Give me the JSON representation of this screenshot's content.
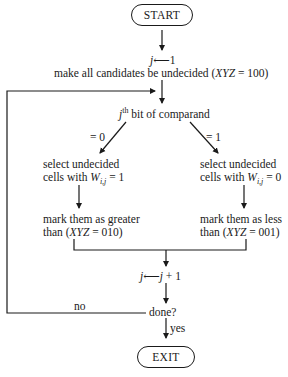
{
  "flowchart": {
    "start": "START",
    "init_assign": {
      "var": "j",
      "arrow": "⟵",
      "value": "1"
    },
    "init_text": "make all candidates be undecided (",
    "init_code": "XYZ",
    "init_eq": " = 100)",
    "decision": {
      "var": "j",
      "sup": "th",
      "text": " bit of comparand"
    },
    "branch_left_label": "= 0",
    "branch_right_label": "= 1",
    "left_select_line1": "select undecided",
    "left_select_line2": "cells with ",
    "left_select_var": "W",
    "left_select_sub": "i,j",
    "left_select_eq": " = 1",
    "right_select_line1": "select undecided",
    "right_select_line2": "cells with ",
    "right_select_var": "W",
    "right_select_sub": "i,j",
    "right_select_eq": " = 0",
    "left_mark_line1": "mark them as greater",
    "left_mark_line2a": "than (",
    "left_mark_code": "XYZ",
    "left_mark_line2b": " = 010)",
    "right_mark_line1": "mark them as less",
    "right_mark_line2a": "than (",
    "right_mark_code": "XYZ",
    "right_mark_line2b": " = 001)",
    "increment": {
      "var": "j",
      "arrow": "⟵",
      "expr_var": "j",
      "expr_rest": " + 1"
    },
    "done_question": "done?",
    "no_label": "no",
    "yes_label": "yes",
    "exit": "EXIT"
  }
}
